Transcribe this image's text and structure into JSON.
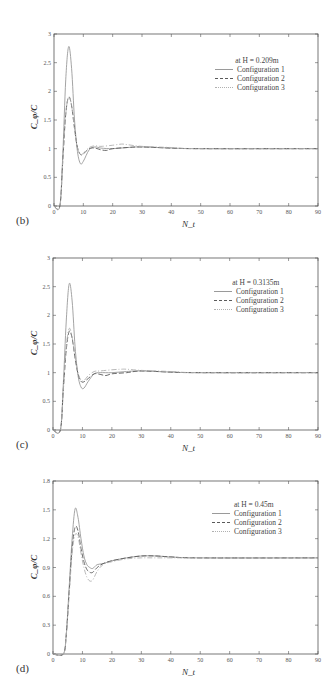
{
  "chart_data": [
    {
      "type": "line",
      "panel_label": "(b)",
      "title": "at H = 0.209m",
      "xlabel": "N_t",
      "ylabel": "C_φ/C",
      "xlim": [
        0,
        90
      ],
      "ylim": [
        0,
        3
      ],
      "xticks": [
        0,
        10,
        20,
        30,
        40,
        50,
        60,
        70,
        80,
        90
      ],
      "yticks": [
        0,
        0.5,
        1,
        1.5,
        2,
        2.5,
        3
      ],
      "ytick_labels": [
        "0",
        "0.5",
        "1",
        "1.5",
        "2",
        "2.5",
        "3"
      ],
      "grid": false,
      "legend_position": "upper right",
      "series": [
        {
          "name": "Configuration 1",
          "style": "solid",
          "x": [
            0,
            2,
            3,
            4,
            5,
            6,
            7,
            8,
            9,
            10,
            12,
            14,
            16,
            20,
            25,
            30,
            40,
            50,
            90
          ],
          "y": [
            0,
            0,
            0.9,
            2.2,
            2.78,
            2.4,
            1.5,
            0.95,
            0.74,
            0.78,
            0.98,
            1.03,
            1.01,
            1.0,
            1.02,
            1.03,
            1.01,
            1.0,
            1.0
          ]
        },
        {
          "name": "Configuration 2",
          "style": "dashed",
          "x": [
            0,
            2,
            3,
            4,
            5,
            6,
            7,
            8,
            9,
            10,
            12,
            14,
            16,
            18,
            20,
            25,
            30,
            40,
            50,
            90
          ],
          "y": [
            0,
            0,
            0.8,
            1.6,
            1.9,
            1.75,
            1.35,
            1.02,
            0.9,
            0.91,
            1.0,
            1.01,
            0.98,
            0.97,
            1.0,
            1.02,
            1.03,
            1.01,
            1.0,
            1.0
          ]
        },
        {
          "name": "Configuration 3",
          "style": "dash-dot",
          "x": [
            0,
            2,
            3,
            4,
            5,
            6,
            7,
            8,
            9,
            10,
            12,
            14,
            16,
            20,
            23,
            25,
            30,
            40,
            50,
            90
          ],
          "y": [
            0,
            0,
            0.8,
            1.6,
            1.9,
            1.75,
            1.35,
            1.02,
            0.9,
            0.92,
            1.02,
            1.05,
            1.04,
            1.06,
            1.08,
            1.07,
            1.04,
            1.02,
            1.0,
            1.0
          ]
        }
      ]
    },
    {
      "type": "line",
      "panel_label": "(c)",
      "title": "at H = 0.3135m",
      "xlabel": "N_t",
      "ylabel": "C_φ/C",
      "xlim": [
        0,
        90
      ],
      "ylim": [
        0,
        3
      ],
      "xticks": [
        0,
        10,
        20,
        30,
        40,
        50,
        60,
        70,
        80,
        90
      ],
      "yticks": [
        0,
        0.5,
        1,
        1.5,
        2,
        2.5,
        3
      ],
      "ytick_labels": [
        "0",
        "0.5",
        "1",
        "1.5",
        "2",
        "2.5",
        "3"
      ],
      "grid": false,
      "legend_position": "upper right",
      "series": [
        {
          "name": "Configuration 1",
          "style": "solid",
          "x": [
            0,
            2.5,
            3.5,
            4.5,
            5.5,
            6.5,
            7.5,
            8.5,
            9.5,
            10.5,
            12,
            14,
            16,
            20,
            25,
            30,
            40,
            50,
            90
          ],
          "y": [
            0,
            0,
            0.8,
            1.9,
            2.55,
            2.25,
            1.45,
            0.95,
            0.75,
            0.73,
            0.85,
            0.98,
            1.0,
            1.0,
            1.02,
            1.03,
            1.01,
            1.0,
            1.0
          ]
        },
        {
          "name": "Configuration 2",
          "style": "dashed",
          "x": [
            0,
            2.5,
            3.5,
            4.5,
            5.5,
            6.5,
            7.5,
            8.5,
            9.5,
            10.5,
            12,
            14,
            16,
            18,
            20,
            25,
            30,
            40,
            50,
            90
          ],
          "y": [
            0,
            0,
            0.7,
            1.4,
            1.72,
            1.6,
            1.25,
            0.98,
            0.85,
            0.84,
            0.9,
            0.98,
            0.97,
            0.95,
            0.98,
            1.0,
            1.03,
            1.01,
            1.0,
            1.0
          ]
        },
        {
          "name": "Configuration 3",
          "style": "dash-dot",
          "x": [
            0,
            2.5,
            3.5,
            4.5,
            5.5,
            6.5,
            7.5,
            8.5,
            9.5,
            10.5,
            12,
            14,
            16,
            20,
            23,
            25,
            30,
            40,
            50,
            90
          ],
          "y": [
            0,
            0,
            0.7,
            1.45,
            1.77,
            1.62,
            1.28,
            1.0,
            0.87,
            0.86,
            0.95,
            1.02,
            1.03,
            1.05,
            1.06,
            1.06,
            1.04,
            1.02,
            1.0,
            1.0
          ]
        }
      ]
    },
    {
      "type": "line",
      "panel_label": "(d)",
      "title": "at H = 0.45m",
      "xlabel": "N_t",
      "ylabel": "C_φ/C",
      "xlim": [
        0,
        90
      ],
      "ylim": [
        0,
        1.8
      ],
      "xticks": [
        0,
        10,
        20,
        30,
        40,
        50,
        60,
        70,
        80,
        90
      ],
      "yticks": [
        0,
        0.3,
        0.6,
        0.9,
        1.2,
        1.5,
        1.8
      ],
      "ytick_labels": [
        "0",
        "0.3",
        "0.6",
        "0.9",
        "1.2",
        "1.5",
        "1.8"
      ],
      "grid": false,
      "legend_position": "upper right",
      "series": [
        {
          "name": "Configuration 1",
          "style": "solid",
          "x": [
            0,
            3.5,
            4.5,
            5.5,
            6.5,
            7.5,
            8.5,
            9.5,
            10.5,
            11.5,
            12.5,
            13.5,
            15,
            17,
            20,
            25,
            30,
            35,
            40,
            50,
            90
          ],
          "y": [
            0,
            0,
            0.2,
            0.7,
            1.2,
            1.51,
            1.42,
            1.2,
            1.02,
            0.93,
            0.9,
            0.89,
            0.93,
            0.94,
            0.97,
            1.0,
            1.02,
            1.02,
            1.01,
            1.0,
            1.0
          ]
        },
        {
          "name": "Configuration 2",
          "style": "dashed",
          "x": [
            0,
            3.5,
            4.5,
            5.5,
            6.5,
            7.5,
            8.5,
            9.5,
            10.5,
            11.5,
            12.5,
            13.5,
            15,
            17,
            20,
            25,
            30,
            35,
            40,
            50,
            90
          ],
          "y": [
            0,
            0,
            0.2,
            0.65,
            1.1,
            1.32,
            1.28,
            1.1,
            0.96,
            0.88,
            0.85,
            0.85,
            0.9,
            0.94,
            0.97,
            1.0,
            1.02,
            1.02,
            1.01,
            1.0,
            1.0
          ]
        },
        {
          "name": "Configuration 3",
          "style": "dash-dot",
          "x": [
            0,
            3.5,
            4.5,
            5.5,
            6.5,
            7.5,
            8.5,
            9.5,
            10.5,
            11.5,
            12.5,
            13.5,
            15,
            17,
            20,
            25,
            30,
            35,
            40,
            50,
            90
          ],
          "y": [
            0,
            0,
            0.2,
            0.62,
            1.05,
            1.24,
            1.22,
            1.05,
            0.9,
            0.8,
            0.76,
            0.77,
            0.86,
            0.93,
            0.96,
            0.99,
            1.0,
            1.0,
            1.0,
            1.0,
            1.0
          ]
        }
      ]
    }
  ],
  "legend": {
    "entries": [
      "Configuration 1",
      "Configuration 2",
      "Configuration 3"
    ]
  },
  "colors": {
    "axis": "#555555",
    "config1": "#9a9a9a",
    "config2": "#5a5a5a",
    "config3": "#b0b0b0"
  }
}
